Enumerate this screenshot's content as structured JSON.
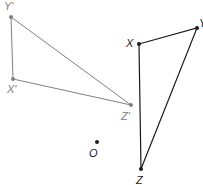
{
  "diagram": {
    "original": {
      "color": "#1a1a1a",
      "points": [
        {
          "label": "X",
          "x": 139,
          "y": 44,
          "lx": 126,
          "ly": 47
        },
        {
          "label": "Y",
          "x": 197,
          "y": 28,
          "lx": 199,
          "ly": 27
        },
        {
          "label": "Z",
          "x": 141,
          "y": 169,
          "lx": 136,
          "ly": 184
        }
      ]
    },
    "image": {
      "color": "#808080",
      "points": [
        {
          "label": "Y'",
          "x": 11,
          "y": 17,
          "lx": 4,
          "ly": 10
        },
        {
          "label": "X'",
          "x": 13,
          "y": 79,
          "lx": 7,
          "ly": 93
        },
        {
          "label": "Z'",
          "x": 131,
          "y": 105,
          "lx": 121,
          "ly": 120
        }
      ]
    },
    "center": {
      "label": "O",
      "x": 97,
      "y": 142,
      "lx": 89,
      "ly": 157,
      "color": "#1a1a1a"
    }
  }
}
